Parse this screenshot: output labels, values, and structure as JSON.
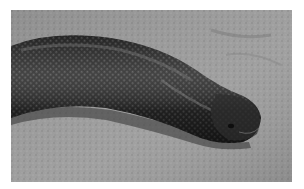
{
  "image": {
    "subject": "snake on sand",
    "style": "grayscale photograph",
    "colors": {
      "border": "#ffffff",
      "sand": "#9a9a9a",
      "sand_dark": "#7d7d7d",
      "snake_body": "#2a2a2a",
      "snake_highlight": "#6a6a6a",
      "snake_shadow": "#141414"
    }
  }
}
